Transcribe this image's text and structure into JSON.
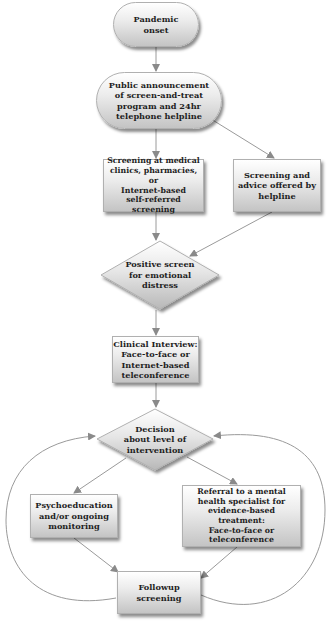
{
  "diagram": {
    "type": "flowchart",
    "nodes": {
      "pandemic_onset": {
        "shape": "rounded",
        "label": "Pandemic\nonset"
      },
      "public_announcement": {
        "shape": "rounded",
        "label": "Public announcement\nof screen-and-treat\nprogram and 24hr\ntelephone helpline"
      },
      "screening_clinics": {
        "shape": "rectangle",
        "label": "Screening at medical\nclinics, pharmacies, or\nInternet-based\nself-referred\nscreening"
      },
      "screening_helpline": {
        "shape": "rectangle",
        "label": "Screening and\nadvice offered by\nhelpline"
      },
      "positive_screen": {
        "shape": "diamond",
        "label": "Positive screen\nfor emotional\ndistress"
      },
      "clinical_interview": {
        "shape": "rectangle",
        "label": "Clinical Interview:\nFace-to-face or\nInternet-based\nteleconference"
      },
      "decision": {
        "shape": "diamond",
        "label": "Decision\nabout level of\nintervention"
      },
      "psychoeducation": {
        "shape": "rectangle",
        "label": "Psychoeducation\nand/or ongoing\nmonitoring"
      },
      "referral": {
        "shape": "rectangle",
        "label": "Referral to a mental\nhealth specialist for\nevidence-based\ntreatment:\nFace-to-face or\nteleconference"
      },
      "followup": {
        "shape": "rectangle",
        "label": "Followup\nscreening"
      }
    },
    "edges": [
      {
        "from": "pandemic_onset",
        "to": "public_announcement"
      },
      {
        "from": "public_announcement",
        "to": "screening_clinics"
      },
      {
        "from": "public_announcement",
        "to": "screening_helpline"
      },
      {
        "from": "screening_clinics",
        "to": "positive_screen"
      },
      {
        "from": "screening_helpline",
        "to": "positive_screen"
      },
      {
        "from": "positive_screen",
        "to": "clinical_interview"
      },
      {
        "from": "clinical_interview",
        "to": "decision"
      },
      {
        "from": "decision",
        "to": "psychoeducation"
      },
      {
        "from": "decision",
        "to": "referral"
      },
      {
        "from": "psychoeducation",
        "to": "followup"
      },
      {
        "from": "referral",
        "to": "followup"
      },
      {
        "from": "followup",
        "to": "decision",
        "style": "curved-left-loop"
      },
      {
        "from": "followup",
        "to": "decision",
        "style": "curved-right-loop"
      }
    ],
    "colors": {
      "edge": "#9a9a9a",
      "node_fill_top": "#ffffff",
      "node_fill_bottom": "#c4c4c4",
      "node_border": "#b0b0b0",
      "text": "#1e1e1e"
    }
  }
}
